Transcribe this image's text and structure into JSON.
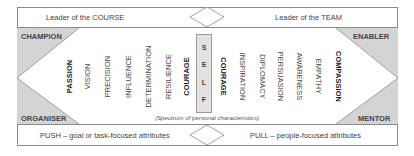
{
  "top_row": {
    "left_label": "Leader of the COURSE",
    "right_label": "Leader of the TEAM"
  },
  "bottom_row": {
    "left_label": "PUSH – goal or task-focused attributes",
    "right_label": "PULL – people-focused attributes"
  },
  "corners": {
    "top_left": "CHAMPION",
    "bottom_left": "ORGANISER",
    "top_right": "ENABLER",
    "bottom_right": "MENTOR"
  },
  "left_attributes": [
    {
      "label": "PASSION",
      "bold": true
    },
    {
      "label": "VISION",
      "bold": false
    },
    {
      "label": "PRECISION",
      "bold": false
    },
    {
      "label": "INFLUENCE",
      "bold": false
    },
    {
      "label": "DETERMINATION",
      "bold": false
    },
    {
      "label": "RESILIENCE",
      "bold": false
    },
    {
      "label": "COURAGE",
      "bold": true
    }
  ],
  "self_letters": [
    "S",
    "E",
    "L",
    "F"
  ],
  "right_attributes": [
    {
      "label": "COURAGE",
      "bold": true
    },
    {
      "label": "INSPIRATION",
      "bold": false
    },
    {
      "label": "DIPLOMACY",
      "bold": false
    },
    {
      "label": "PERSUASION",
      "bold": false
    },
    {
      "label": "AWARENESS",
      "bold": false
    },
    {
      "label": "EMPATHY",
      "bold": false
    },
    {
      "label": "COMPASSION",
      "bold": true
    }
  ],
  "caption": "(Spectrum of personal characteristics)",
  "colors": {
    "shaded": "#d4d4d4",
    "border": "#8a8a8a",
    "self_box": "#e2e2e2"
  }
}
